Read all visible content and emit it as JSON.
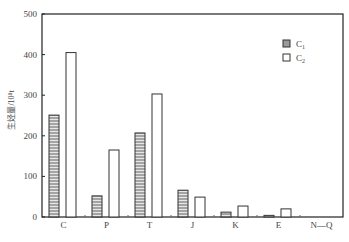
{
  "chart_data": {
    "type": "bar",
    "title": "",
    "xlabel": "",
    "ylabel": "生烃量/10⁸t",
    "ylim": [
      0,
      500
    ],
    "yticks": [
      0,
      100,
      200,
      300,
      400,
      500
    ],
    "grid": false,
    "legend_position": "upper right",
    "categories": [
      "C",
      "P",
      "T",
      "J",
      "K",
      "E",
      "N—Q"
    ],
    "series": [
      {
        "name": "C1",
        "pattern": "horizontal-hatch",
        "values": [
          251,
          52,
          207,
          66,
          12,
          4,
          0
        ]
      },
      {
        "name": "C2",
        "pattern": "open",
        "values": [
          405,
          165,
          303,
          49,
          27,
          20,
          0
        ]
      }
    ]
  },
  "axis": {
    "ylabel": "生烃量/10⁸t",
    "yticks": [
      "0",
      "100",
      "200",
      "300",
      "400",
      "500"
    ],
    "xticks": [
      "C",
      "P",
      "T",
      "J",
      "K",
      "E",
      "N—Q"
    ]
  },
  "legend": {
    "items": [
      {
        "label": "C",
        "sub": "1",
        "pattern": "hatched"
      },
      {
        "label": "C",
        "sub": "2",
        "pattern": "open"
      }
    ]
  },
  "colors": {
    "axis": "#222222",
    "bar_stroke": "#333333",
    "hatch_fill": "#9a9a9a",
    "open_fill": "#ffffff"
  }
}
